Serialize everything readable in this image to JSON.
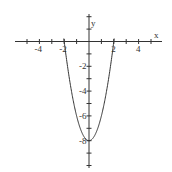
{
  "chart_data": {
    "type": "line",
    "title": "",
    "xlabel": "x",
    "ylabel": "y",
    "function": "y = 2x^2 - 8",
    "xlim": [
      -6,
      6
    ],
    "ylim": [
      -10.5,
      2.5
    ],
    "grid": false,
    "x_tick_labels": [
      "-4",
      "-2",
      "2",
      "4"
    ],
    "y_tick_labels": [
      "-2",
      "-4",
      "-6",
      "-8"
    ],
    "series": [
      {
        "name": "parabola",
        "x": [
          -2,
          -1.5,
          -1,
          -0.5,
          0,
          0.5,
          1,
          1.5,
          2
        ],
        "y": [
          0,
          -3.5,
          -6,
          -7.5,
          -8,
          -7.5,
          -6,
          -3.5,
          0
        ]
      }
    ],
    "color": "#333333"
  },
  "axes": {
    "x_label": "x",
    "y_label": "y"
  }
}
